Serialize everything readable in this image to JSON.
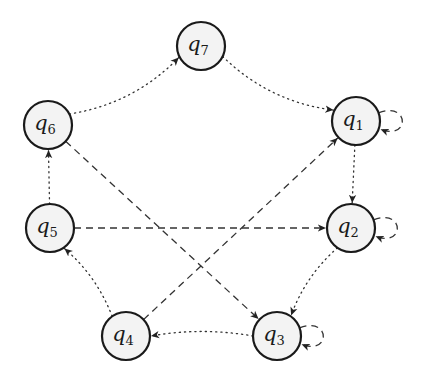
{
  "diagram": {
    "type": "state-automaton",
    "colors": {
      "node_fill": "#f3f3f3",
      "node_stroke": "#1a1a1a",
      "edge": "#333333"
    },
    "node_radius": 24,
    "nodes": [
      {
        "id": "q1",
        "base": "q",
        "sub": "1",
        "x": 356,
        "y": 121
      },
      {
        "id": "q2",
        "base": "q",
        "sub": "2",
        "x": 351,
        "y": 228
      },
      {
        "id": "q3",
        "base": "q",
        "sub": "3",
        "x": 277,
        "y": 336
      },
      {
        "id": "q4",
        "base": "q",
        "sub": "4",
        "x": 126,
        "y": 336
      },
      {
        "id": "q5",
        "base": "q",
        "sub": "5",
        "x": 50,
        "y": 228
      },
      {
        "id": "q6",
        "base": "q",
        "sub": "6",
        "x": 48,
        "y": 125
      },
      {
        "id": "q7",
        "base": "q",
        "sub": "7",
        "x": 201,
        "y": 46
      }
    ],
    "edges": [
      {
        "from": "q7",
        "to": "q1",
        "style": "dotted",
        "bend": 0.12
      },
      {
        "from": "q1",
        "to": "q2",
        "style": "dotted",
        "bend": 0.0
      },
      {
        "from": "q2",
        "to": "q3",
        "style": "dotted",
        "bend": 0.08
      },
      {
        "from": "q3",
        "to": "q4",
        "style": "dotted",
        "bend": 0.06
      },
      {
        "from": "q4",
        "to": "q5",
        "style": "dotted",
        "bend": 0.08
      },
      {
        "from": "q5",
        "to": "q6",
        "style": "dotted",
        "bend": 0.0
      },
      {
        "from": "q6",
        "to": "q7",
        "style": "dotted",
        "bend": 0.12
      },
      {
        "from": "q6",
        "to": "q3",
        "style": "dashed",
        "bend": 0
      },
      {
        "from": "q5",
        "to": "q2",
        "style": "dashed",
        "bend": 0
      },
      {
        "from": "q4",
        "to": "q1",
        "style": "dashed",
        "bend": 0
      },
      {
        "from": "q1",
        "to": "q1",
        "style": "dashed",
        "loop": "right"
      },
      {
        "from": "q2",
        "to": "q2",
        "style": "dashed",
        "loop": "right"
      },
      {
        "from": "q3",
        "to": "q3",
        "style": "dashed",
        "loop": "right"
      }
    ]
  }
}
